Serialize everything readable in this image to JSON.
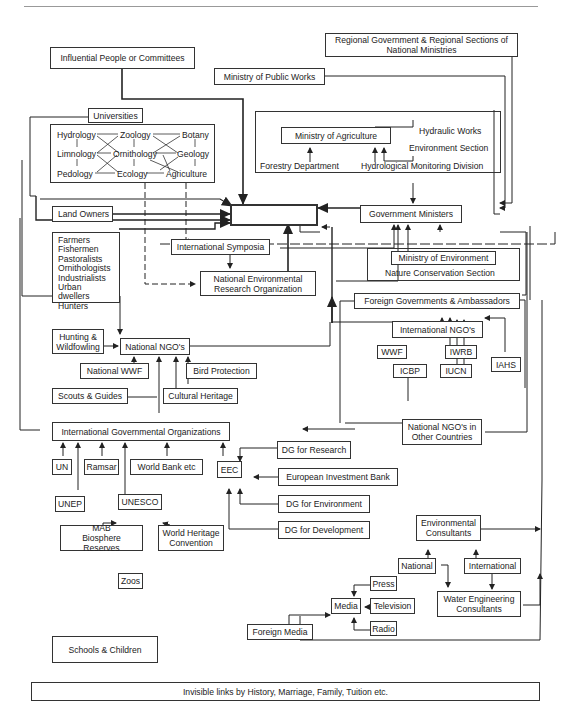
{
  "diagram": {
    "center": "THE WETLAND",
    "nodes": {
      "influential": "Influential People or Committees",
      "regional_gov": "Regional Government & Regional Sections of\nNational Ministries",
      "public_works": "Ministry of Public Works",
      "universities": "Universities",
      "disciplines": [
        "Hydrology",
        "Zoology",
        "Botany",
        "Limnology",
        "Ornithology",
        "Geology",
        "Pedology",
        "Ecology",
        "Agriculture"
      ],
      "ministry_agriculture": "Ministry of Agriculture",
      "hydraulic_works": "Hydraulic Works",
      "environment_section": "Environment Section",
      "forestry_department": "Forestry Department",
      "hydrological_monitoring": "Hydrological Monitoring Division",
      "land_owners": "Land Owners",
      "stakeholders": "Farmers\nFishermen\nPastoralists\nOrnithologists\nIndustrialists\nUrban dwellers\nHunters",
      "government_ministers": "Government Ministers",
      "international_symposia": "International Symposia",
      "national_env_research": "National Environmental\nResearch Organization",
      "ministry_environment": "Ministry of Environment",
      "nature_conservation": "Nature Conservation Section",
      "foreign_governments": "Foreign Governments & Ambassadors",
      "international_ngos": "International NGO's",
      "wwf": "WWF",
      "iwrb": "IWRB",
      "icbp": "ICBP",
      "iucn": "IUCN",
      "iahs": "IAHS",
      "hunting": "Hunting &\nWildfowling",
      "national_ngos": "National NGO's",
      "national_wwf": "National WWF",
      "bird_protection": "Bird Protection",
      "scouts": "Scouts & Guides",
      "cultural_heritage": "Cultural Heritage",
      "national_ngos_other": "National NGO's in\nOther Countries",
      "intl_gov_orgs": "International Governmental Organizations",
      "un": "UN",
      "ramsar": "Ramsar",
      "world_bank": "World Bank etc",
      "eec": "EEC",
      "dg_research": "DG for Research",
      "eib": "European Investment Bank",
      "dg_environment": "DG for Environment",
      "dg_development": "DG for Development",
      "unep": "UNEP",
      "unesco": "UNESCO",
      "mab": "MAB\nBiosphere Reserves",
      "world_heritage": "World Heritage\nConvention",
      "zoos": "Zoos",
      "env_consultants": "Environmental\nConsultants",
      "national": "National",
      "international": "International",
      "water_engineering": "Water Engineering\nConsultants",
      "press": "Press",
      "media": "Media",
      "television": "Television",
      "radio": "Radio",
      "foreign_media": "Foreign Media",
      "schools": "Schools & Children",
      "invisible_links": "Invisible links by History, Marriage, Family, Tuition etc."
    }
  }
}
